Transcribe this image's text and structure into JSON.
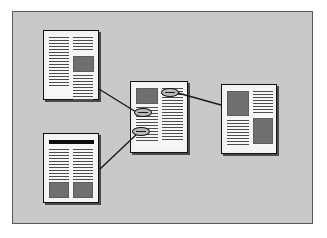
{
  "figure": {
    "colors": {
      "page_background": "#ffffff",
      "panel_background": "#c9c9c9",
      "panel_border": "#5a5a5a",
      "document_paper": "#f6f6f6",
      "document_border": "#111111",
      "document_shadow": "#4a4a4a",
      "text_line": "#4d4d4d",
      "image_block": "#6f6f6f",
      "header_bar": "#0d0d0d",
      "connector_line": "#1a1a1a",
      "link_marker_fill": "#b9b9b9"
    }
  },
  "panel": {
    "x": 12,
    "y": 11,
    "width": 301,
    "height": 213
  },
  "documents": [
    {
      "id": "doc-top-left",
      "name": "top-left-document",
      "x": 43,
      "y": 30,
      "width": 56,
      "height": 70,
      "has_header_bar": false,
      "columns": 2,
      "text_lines_left": 17,
      "text_lines_right": 17,
      "image_blocks": 1,
      "link_markers": 0
    },
    {
      "id": "doc-bottom-left",
      "name": "bottom-left-document",
      "x": 43,
      "y": 133,
      "width": 56,
      "height": 70,
      "has_header_bar": true,
      "columns": 2,
      "text_lines_left": 11,
      "text_lines_right": 11,
      "image_blocks": 2,
      "link_markers": 0
    },
    {
      "id": "doc-center",
      "name": "center-document",
      "x": 130,
      "y": 81,
      "width": 58,
      "height": 72,
      "has_header_bar": false,
      "columns": 2,
      "text_lines_left": 12,
      "text_lines_right": 18,
      "image_blocks": 1,
      "link_markers": 3
    },
    {
      "id": "doc-right",
      "name": "right-document",
      "x": 221,
      "y": 84,
      "width": 56,
      "height": 70,
      "has_header_bar": false,
      "columns": 2,
      "text_lines_left": 9,
      "text_lines_right": 18,
      "image_blocks": 2,
      "link_markers": 0
    }
  ],
  "link_markers": [
    {
      "id": "marker-top-right",
      "name": "link-marker-to-right-document",
      "cx": 170,
      "cy": 92,
      "rx": 9,
      "ry": 4
    },
    {
      "id": "marker-mid-left",
      "name": "link-marker-to-top-left-document",
      "cx": 143,
      "cy": 112,
      "rx": 9,
      "ry": 4
    },
    {
      "id": "marker-lower-left",
      "name": "link-marker-to-bottom-left-document",
      "cx": 141,
      "cy": 131,
      "rx": 9,
      "ry": 4
    }
  ],
  "connectors": [
    {
      "id": "connector-topleft-to-center",
      "name": "connector-top-left-to-center",
      "from": "doc-top-left",
      "to": "marker-mid-left",
      "x1": 99,
      "y1": 89,
      "x2": 135,
      "y2": 112
    },
    {
      "id": "connector-bottomleft-to-center",
      "name": "connector-bottom-left-to-center",
      "from": "doc-bottom-left",
      "to": "marker-lower-left",
      "x1": 100,
      "y1": 169,
      "x2": 137,
      "y2": 133
    },
    {
      "id": "connector-center-to-right",
      "name": "connector-center-to-right",
      "from": "marker-top-right",
      "to": "doc-right",
      "x1": 179,
      "y1": 93,
      "x2": 221,
      "y2": 105
    }
  ]
}
